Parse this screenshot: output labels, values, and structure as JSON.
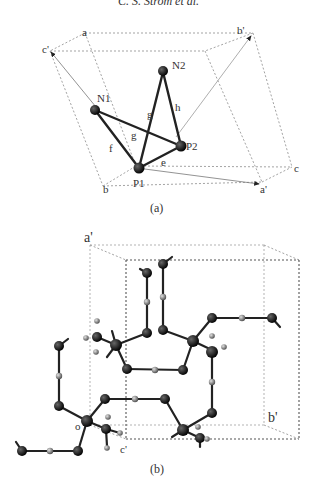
{
  "header": {
    "running_head": "C. S. Strom et al."
  },
  "panel_a": {
    "caption": "(a)",
    "axis_labels": {
      "a": "a",
      "c_prime": "c'",
      "b_prime": "b'",
      "a_prime": "a'",
      "b": "b",
      "c": "c"
    },
    "atoms": [
      {
        "id": "N1",
        "label": "N1"
      },
      {
        "id": "N2",
        "label": "N2"
      },
      {
        "id": "P1",
        "label": "P1"
      },
      {
        "id": "P2",
        "label": "P2"
      }
    ],
    "bond_labels": {
      "e": "e",
      "f": "f",
      "g1": "g",
      "g2": "g",
      "h": "h"
    }
  },
  "panel_b": {
    "caption": "(b)",
    "axis_labels": {
      "a_prime": "a'",
      "b_prime": "b'",
      "c_prime": "c'",
      "origin": "o"
    }
  },
  "colors": {
    "atom": "#111111",
    "bond": "#333333",
    "cell_line": "#888888",
    "light_atom": "#9a9a9a"
  }
}
